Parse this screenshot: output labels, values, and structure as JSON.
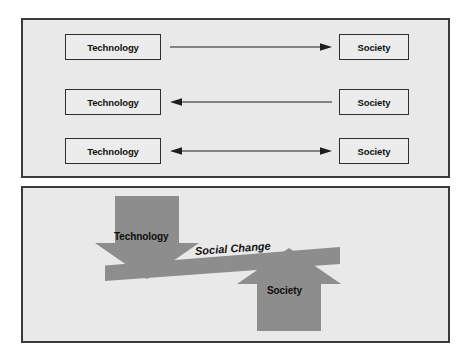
{
  "diagram": {
    "colors": {
      "panel_background": "#e9e9e9",
      "panel_border": "#3a3a3a",
      "box_fill": "#ececec",
      "box_border": "#2f2f2f",
      "arrow_stroke": "#1e1e1e",
      "figure_gray": "#8d8d8d",
      "text": "#0d0d0d"
    }
  },
  "top_panel": {
    "rows": [
      {
        "left_label": "Technology",
        "right_label": "Society",
        "arrow_direction": "right",
        "arrow_icon": "arrow-right-icon"
      },
      {
        "left_label": "Technology",
        "right_label": "Society",
        "arrow_direction": "left",
        "arrow_icon": "arrow-left-icon"
      },
      {
        "left_label": "Technology",
        "right_label": "Society",
        "arrow_direction": "both",
        "arrow_icon": "arrow-bidirectional-icon"
      }
    ]
  },
  "bottom_panel": {
    "down_arrow_label": "Technology",
    "up_arrow_label": "Society",
    "beam_label": "Social Change"
  }
}
